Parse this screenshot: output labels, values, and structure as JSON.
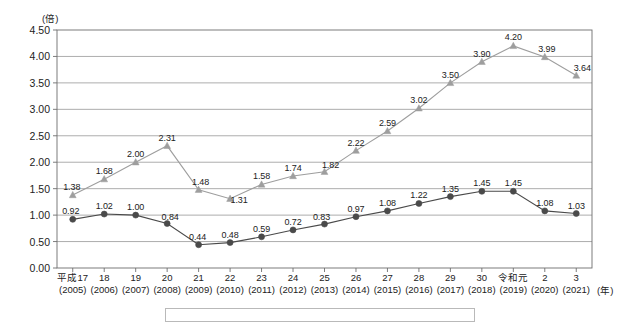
{
  "chart_data": {
    "type": "line",
    "title": "",
    "subtitle": "",
    "xlabel": "(年)",
    "ylabel": "(倍)",
    "ylim": [
      0.0,
      4.5
    ],
    "yticks": [
      "0.00",
      "0.50",
      "1.00",
      "1.50",
      "2.00",
      "2.50",
      "3.00",
      "3.50",
      "4.00",
      "4.50"
    ],
    "grid": true,
    "legend_position": "bottom",
    "categories": [
      "平成17",
      "18",
      "19",
      "20",
      "21",
      "22",
      "23",
      "24",
      "25",
      "26",
      "27",
      "28",
      "29",
      "30",
      "令和元",
      "2",
      "3"
    ],
    "categories_western": [
      "(2005)",
      "(2006)",
      "(2007)",
      "(2008)",
      "(2009)",
      "(2010)",
      "(2011)",
      "(2012)",
      "(2013)",
      "(2014)",
      "(2015)",
      "(2016)",
      "(2017)",
      "(2018)",
      "(2019)",
      "(2020)",
      "(2021)"
    ],
    "series": [
      {
        "name": "series-triangle-upper",
        "marker": "triangle",
        "color": "#9e9e9e",
        "values": [
          1.38,
          1.68,
          2.0,
          2.31,
          1.48,
          1.31,
          1.58,
          1.74,
          1.82,
          2.22,
          2.59,
          3.02,
          3.5,
          3.9,
          4.2,
          3.99,
          3.64
        ],
        "labels": [
          "1.38",
          "1.68",
          "2.00",
          "2.31",
          "1.48",
          "1.31",
          "1.58",
          "1.74",
          "1.82",
          "2.22",
          "2.59",
          "3.02",
          "3.50",
          "3.90",
          "4.20",
          "3.99",
          "3.64"
        ]
      },
      {
        "name": "series-circle-lower",
        "marker": "circle",
        "color": "#4a4a4a",
        "values": [
          0.92,
          1.02,
          1.0,
          0.84,
          0.44,
          0.48,
          0.59,
          0.72,
          0.83,
          0.97,
          1.08,
          1.22,
          1.35,
          1.45,
          1.45,
          1.08,
          1.03
        ],
        "labels": [
          "0.92",
          "1.02",
          "1.00",
          "0.84",
          "0.44",
          "0.48",
          "0.59",
          "0.72",
          "0.83",
          "0.97",
          "1.08",
          "1.22",
          "1.35",
          "1.45",
          "1.45",
          "1.08",
          "1.03"
        ]
      }
    ]
  },
  "legend": {
    "entries": []
  }
}
